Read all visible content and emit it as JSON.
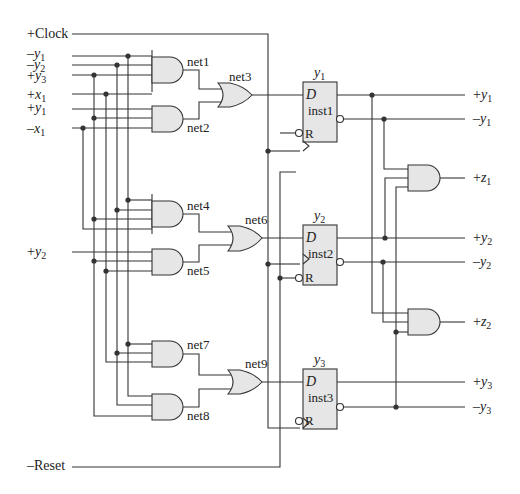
{
  "diagram": {
    "type": "sequential-logic-circuit",
    "inputs": {
      "clock": {
        "sign": "+",
        "name": "Clock"
      },
      "reset": {
        "sign": "–",
        "name": "Reset"
      },
      "signals": [
        {
          "sign": "–",
          "var": "y",
          "sub": "1"
        },
        {
          "sign": "–",
          "var": "y",
          "sub": "2"
        },
        {
          "sign": "+",
          "var": "y",
          "sub": "3"
        },
        {
          "sign": "+",
          "var": "x",
          "sub": "1"
        },
        {
          "sign": "+",
          "var": "y",
          "sub": "1"
        },
        {
          "sign": "–",
          "var": "x",
          "sub": "1"
        },
        {
          "sign": "+",
          "var": "y",
          "sub": "2"
        }
      ]
    },
    "nets": {
      "net1": "net1",
      "net2": "net2",
      "net3": "net3",
      "net4": "net4",
      "net5": "net5",
      "net6": "net6",
      "net7": "net7",
      "net8": "net8",
      "net9": "net9"
    },
    "flipflops": [
      {
        "title_var": "y",
        "title_sub": "1",
        "name": "inst1",
        "d": "D",
        "r": "R"
      },
      {
        "title_var": "y",
        "title_sub": "2",
        "name": "inst2",
        "d": "D",
        "r": "R"
      },
      {
        "title_var": "y",
        "title_sub": "3",
        "name": "inst3",
        "d": "D",
        "r": "R"
      }
    ],
    "outputs": [
      {
        "sign": "+",
        "var": "y",
        "sub": "1"
      },
      {
        "sign": "–",
        "var": "y",
        "sub": "1"
      },
      {
        "sign": "+",
        "var": "z",
        "sub": "1"
      },
      {
        "sign": "+",
        "var": "y",
        "sub": "2"
      },
      {
        "sign": "–",
        "var": "y",
        "sub": "2"
      },
      {
        "sign": "+",
        "var": "z",
        "sub": "2"
      },
      {
        "sign": "+",
        "var": "y",
        "sub": "3"
      },
      {
        "sign": "–",
        "var": "y",
        "sub": "3"
      }
    ],
    "colors": {
      "wire": "#333333",
      "gate_fill": "#e6e6e6",
      "background": "#ffffff"
    }
  }
}
